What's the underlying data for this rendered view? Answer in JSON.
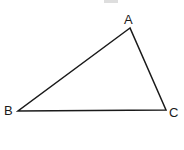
{
  "figure": {
    "kind": "geometry-diagram",
    "shape_name": "triangle",
    "background_color": "#ffffff",
    "stroke_color": "#1a1a1a",
    "stroke_width": 1.5,
    "canvas": {
      "width": 184,
      "height": 150
    },
    "vertices": [
      {
        "id": "A",
        "label": "A",
        "x": 130,
        "y": 28,
        "label_x": 124,
        "label_y": 13,
        "position": "apex-top-right"
      },
      {
        "id": "B",
        "label": "B",
        "x": 18,
        "y": 111,
        "label_x": 4,
        "label_y": 104,
        "position": "bottom-left"
      },
      {
        "id": "C",
        "label": "C",
        "x": 166,
        "y": 110,
        "label_x": 169,
        "label_y": 106,
        "position": "bottom-right"
      }
    ],
    "edges": [
      {
        "id": "AB",
        "from": "A",
        "to": "B",
        "x1": 130,
        "y1": 28,
        "x2": 18,
        "y2": 111
      },
      {
        "id": "BC",
        "from": "B",
        "to": "C",
        "x1": 18,
        "y1": 111,
        "x2": 166,
        "y2": 110
      },
      {
        "id": "CA",
        "from": "C",
        "to": "A",
        "x1": 166,
        "y1": 110,
        "x2": 130,
        "y2": 28
      }
    ],
    "artifact": {
      "name": "cropped-text-smudge",
      "color": "#d8d8d8",
      "x": 104,
      "y": 0,
      "width": 14,
      "height": 3
    }
  }
}
